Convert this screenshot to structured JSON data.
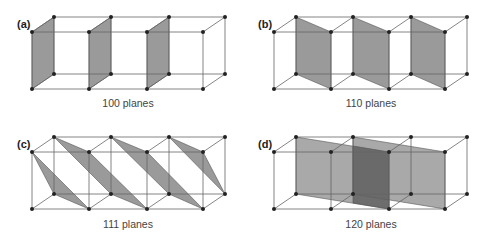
{
  "panels": [
    {
      "id": "a",
      "label": "(a)",
      "caption": "100 planes"
    },
    {
      "id": "b",
      "label": "(b)",
      "caption": "110 planes"
    },
    {
      "id": "c",
      "label": "(c)",
      "caption": "111 planes"
    },
    {
      "id": "d",
      "label": "(d)",
      "caption": "120 planes"
    }
  ],
  "colors": {
    "plane_fill": "#9a9a9a",
    "overlap_fill": "#5e5e5e",
    "edge": "#555555",
    "atom": "#222222"
  }
}
